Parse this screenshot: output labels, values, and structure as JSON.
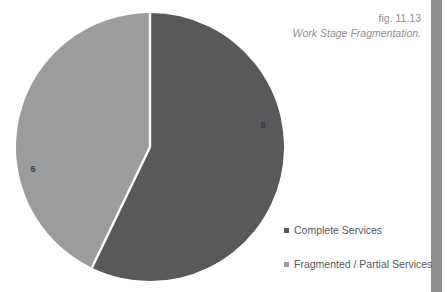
{
  "figure": {
    "number": "fig. 11.13",
    "title": "Work Stage Fragmentation."
  },
  "colors": {
    "complete_services": "#58595b",
    "fragmented_services": "#9b9c9e",
    "caption_text": "#8e8f91",
    "legend_text": "#58595b",
    "edge_bar": "#8d8e90",
    "background": "#ffffff",
    "slice_divider": "#ffffff"
  },
  "legend": {
    "items": [
      {
        "label": "Complete Services",
        "swatch": "#58595b"
      },
      {
        "label": "Fragmented / Partial Services",
        "swatch": "#9b9c9e"
      }
    ]
  },
  "chart_data": {
    "type": "pie",
    "title": "Work Stage Fragmentation.",
    "categories": [
      "Complete Services",
      "Fragmented / Partial Services"
    ],
    "values": [
      8,
      6
    ],
    "data_labels": [
      "8",
      "6"
    ],
    "colors": [
      "#58595b",
      "#9b9c9e"
    ],
    "start_angle_deg": 0,
    "direction": "clockwise",
    "legend_position": "right",
    "grid": false,
    "slices": [
      {
        "name": "Complete Services",
        "value": 8,
        "label": "8",
        "color": "#58595b",
        "start_angle_deg": 0,
        "end_angle_deg": 205.7,
        "percent": 57.1,
        "label_x": 263,
        "label_y": 128
      },
      {
        "name": "Fragmented / Partial Services",
        "value": 6,
        "label": "6",
        "color": "#9b9c9e",
        "start_angle_deg": 205.7,
        "end_angle_deg": 360,
        "percent": 42.9,
        "label_x": 33,
        "label_y": 172
      }
    ]
  }
}
